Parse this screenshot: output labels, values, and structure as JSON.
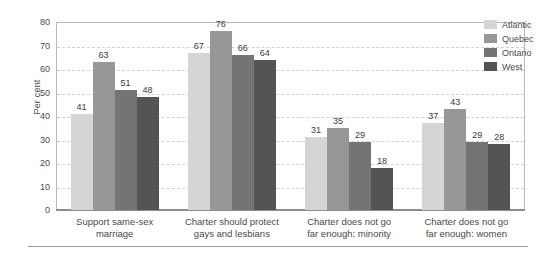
{
  "chart_data": {
    "type": "bar",
    "title": "",
    "subtitle": "",
    "xlabel": "",
    "ylabel": "Per cent",
    "ylim": [
      0,
      80
    ],
    "ytick_step": 10,
    "yticks": [
      80,
      70,
      60,
      50,
      40,
      30,
      20,
      10,
      0
    ],
    "grid": true,
    "grid_style": "dashed-horizontal",
    "legend_position": "right",
    "categories": [
      "Support same-sex marriage",
      "Charter should protect gays and lesbians",
      "Charter does not go far enough: minority",
      "Charter does not go far enough: women"
    ],
    "category_lines": [
      [
        "Support same-sex",
        "marriage"
      ],
      [
        "Charter should protect",
        "gays and lesbians"
      ],
      [
        "Charter does not go",
        "far enough: minority"
      ],
      [
        "Charter does not go",
        "far enough: women"
      ]
    ],
    "series": [
      {
        "name": "Atlantic",
        "color": "#d5d5d5",
        "values": [
          41,
          67,
          31,
          37
        ]
      },
      {
        "name": "Quebec",
        "color": "#979797",
        "values": [
          63,
          76,
          35,
          43
        ]
      },
      {
        "name": "Ontario",
        "color": "#747474",
        "values": [
          51,
          66,
          29,
          29
        ]
      },
      {
        "name": "West",
        "color": "#545454",
        "values": [
          48,
          64,
          18,
          28
        ]
      }
    ]
  },
  "axis": {
    "y_title": "Per cent"
  },
  "legend": {
    "items": [
      {
        "label": "Atlantic"
      },
      {
        "label": "Quebec"
      },
      {
        "label": "Ontario"
      },
      {
        "label": "West"
      }
    ]
  }
}
